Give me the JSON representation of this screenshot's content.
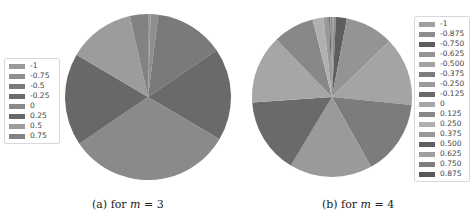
{
  "chart_data": [
    {
      "type": "pie",
      "caption_prefix": "(a) for ",
      "caption_var": "m",
      "caption_suffix": " = 3",
      "legend_position": "left",
      "labels": [
        "-1",
        "-0.75",
        "-0.5",
        "-0.25",
        "0",
        "0.25",
        "0.5",
        "0.75"
      ],
      "values": [
        0.5,
        1.5,
        13.5,
        18.0,
        32.0,
        18.0,
        13.0,
        3.5
      ],
      "colors": [
        "#9a9a9a",
        "#8e8e8e",
        "#7a7a7a",
        "#6a6a6a",
        "#8a8a8a",
        "#686868",
        "#9c9c9c",
        "#828282"
      ],
      "start_angle_deg": 0,
      "direction": "clockwise"
    },
    {
      "type": "pie",
      "caption_prefix": "(b) for ",
      "caption_var": "m",
      "caption_suffix": " = 4",
      "legend_position": "right",
      "labels": [
        "-1",
        "-0.875",
        "-0.750",
        "-0.625",
        "-0.500",
        "-0.375",
        "-0.250",
        "-0.125",
        "0",
        "0.125",
        "0.250",
        "0.375",
        "0.500",
        "0.625",
        "0.750",
        "0.875"
      ],
      "values": [
        0.3,
        0.5,
        2.2,
        9.7,
        13.9,
        15.3,
        16.7,
        15.3,
        13.9,
        8.3,
        2.2,
        1.1,
        0.3,
        0.1,
        0.1,
        0.1
      ],
      "colors": [
        "#a0a0a0",
        "#8c8c8c",
        "#5e5e5e",
        "#949494",
        "#a4a4a4",
        "#7c7c7c",
        "#9a9a9a",
        "#6a6a6a",
        "#a6a6a6",
        "#888888",
        "#b0b0b0",
        "#989898",
        "#606060",
        "#9e9e9e",
        "#7e7e7e",
        "#585858"
      ],
      "start_angle_deg": 0,
      "direction": "clockwise"
    }
  ],
  "captions": {
    "a": {
      "prefix": "(a) for ",
      "var": "m",
      "suffix": " = 3"
    },
    "b": {
      "prefix": "(b) for ",
      "var": "m",
      "suffix": " = 4"
    }
  },
  "legend_a": {
    "items": [
      {
        "label": "-1",
        "color": "#9a9a9a"
      },
      {
        "label": "-0.75",
        "color": "#8e8e8e"
      },
      {
        "label": "-0.5",
        "color": "#7a7a7a"
      },
      {
        "label": "-0.25",
        "color": "#6a6a6a"
      },
      {
        "label": "0",
        "color": "#8a8a8a"
      },
      {
        "label": "0.25",
        "color": "#686868"
      },
      {
        "label": "0.5",
        "color": "#9c9c9c"
      },
      {
        "label": "0.75",
        "color": "#828282"
      }
    ]
  },
  "legend_b": {
    "items": [
      {
        "label": "-1",
        "color": "#a0a0a0"
      },
      {
        "label": "-0.875",
        "color": "#8c8c8c"
      },
      {
        "label": "-0.750",
        "color": "#5e5e5e"
      },
      {
        "label": "-0.625",
        "color": "#949494"
      },
      {
        "label": "-0.500",
        "color": "#a4a4a4"
      },
      {
        "label": "-0.375",
        "color": "#7c7c7c"
      },
      {
        "label": "-0.250",
        "color": "#9a9a9a"
      },
      {
        "label": "-0.125",
        "color": "#6a6a6a"
      },
      {
        "label": "0",
        "color": "#a6a6a6"
      },
      {
        "label": "0.125",
        "color": "#888888"
      },
      {
        "label": "0.250",
        "color": "#b0b0b0"
      },
      {
        "label": "0.375",
        "color": "#989898"
      },
      {
        "label": "0.500",
        "color": "#606060"
      },
      {
        "label": "0.625",
        "color": "#9e9e9e"
      },
      {
        "label": "0.750",
        "color": "#7e7e7e"
      },
      {
        "label": "0.875",
        "color": "#585858"
      }
    ]
  }
}
